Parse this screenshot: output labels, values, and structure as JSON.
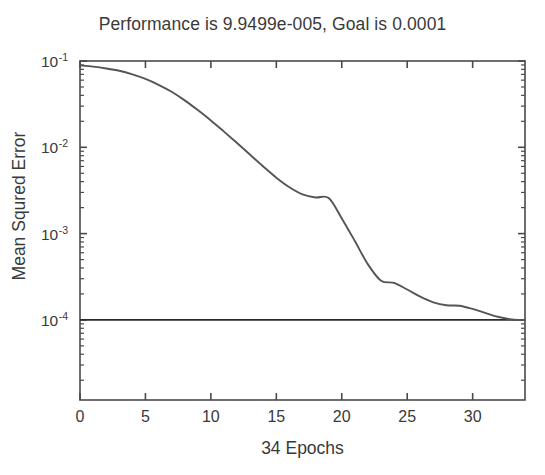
{
  "figure": {
    "width": 545,
    "height": 475,
    "background": "#ffffff",
    "axis_color": "#4a4a4a",
    "curve_color": "#555555",
    "goal_color": "#2b2b2b",
    "text_color": "#3a3a3a"
  },
  "title": "Performance is 9.9499e-005, Goal is 0.0001",
  "ylabel": "Mean Squred Error",
  "xlabel": "34 Epochs",
  "ytick_labels": [
    {
      "mantissa": "10",
      "exponent": "-1"
    },
    {
      "mantissa": "10",
      "exponent": "-2"
    },
    {
      "mantissa": "10",
      "exponent": "-3"
    },
    {
      "mantissa": "10",
      "exponent": "-4"
    }
  ],
  "xtick_labels": [
    "0",
    "5",
    "10",
    "15",
    "20",
    "25",
    "30"
  ],
  "chart_data": {
    "type": "line",
    "title": "Performance is 9.9499e-005, Goal is 0.0001",
    "xlabel": "34 Epochs",
    "ylabel": "Mean Squred Error",
    "yscale": "log",
    "xlim": [
      0,
      34
    ],
    "ylim": [
      1e-05,
      0.1
    ],
    "yticks": [
      0.1,
      0.01,
      0.001,
      0.0001
    ],
    "xticks": [
      0,
      5,
      10,
      15,
      20,
      25,
      30
    ],
    "grid": false,
    "legend": false,
    "final_performance": 9.9499e-05,
    "goal": 0.0001,
    "epochs": 34,
    "series": [
      {
        "name": "Training",
        "color": "#555555",
        "x": [
          0,
          1,
          2,
          3,
          4,
          5,
          6,
          7,
          8,
          9,
          10,
          11,
          12,
          13,
          14,
          15,
          16,
          17,
          18,
          19,
          20,
          21,
          22,
          23,
          24,
          25,
          26,
          27,
          28,
          29,
          30,
          31,
          32,
          33,
          34
        ],
        "values": [
          0.089,
          0.086,
          0.082,
          0.077,
          0.07,
          0.062,
          0.053,
          0.044,
          0.035,
          0.027,
          0.0205,
          0.0152,
          0.0112,
          0.0082,
          0.006,
          0.00445,
          0.00345,
          0.00285,
          0.00262,
          0.00258,
          0.0015,
          0.00082,
          0.00044,
          0.000285,
          0.000268,
          0.000225,
          0.000186,
          0.00016,
          0.000148,
          0.000146,
          0.000134,
          0.00012,
          0.000108,
          0.000101,
          9.9499e-05
        ]
      },
      {
        "name": "Goal",
        "color": "#2b2b2b",
        "x": [
          0,
          34
        ],
        "values": [
          0.0001,
          0.0001
        ]
      }
    ]
  },
  "axes_geometry": {
    "left": 80,
    "right": 525,
    "top": 61,
    "bottom": 400,
    "decade_px": 86.3,
    "top_decade_value": -1
  }
}
